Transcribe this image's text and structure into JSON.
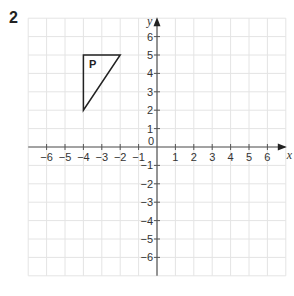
{
  "question_number": "2",
  "chart_data": {
    "type": "scatter",
    "title": "",
    "xlabel": "x",
    "ylabel": "y",
    "xlim": [
      -7,
      7
    ],
    "ylim": [
      -7,
      7
    ],
    "grid": true,
    "x_ticks": [
      -6,
      -5,
      -4,
      -3,
      -2,
      -1,
      1,
      2,
      3,
      4,
      5,
      6
    ],
    "y_ticks": [
      -6,
      -5,
      -4,
      -3,
      -2,
      -1,
      1,
      2,
      3,
      4,
      5,
      6
    ],
    "origin_label": "0",
    "shapes": [
      {
        "name": "P",
        "type": "triangle",
        "vertices": [
          [
            -4,
            5
          ],
          [
            -2,
            5
          ],
          [
            -4,
            2
          ]
        ],
        "label_position": [
          -3.5,
          4.5
        ]
      }
    ]
  },
  "colors": {
    "grid": "#e4e4e4",
    "axis": "#555555",
    "shape": "#222222"
  }
}
